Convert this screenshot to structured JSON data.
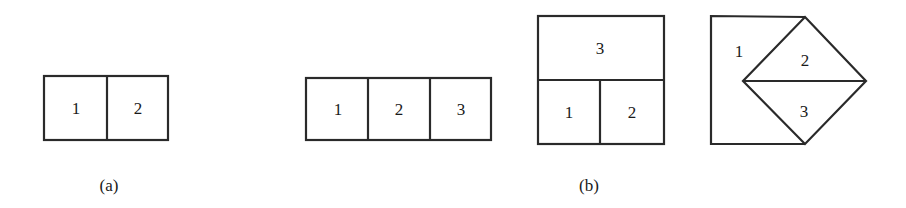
{
  "figure_a": {
    "caption": "(a)",
    "two_cell_row": {
      "cells": [
        "1",
        "2"
      ]
    }
  },
  "figure_b": {
    "caption": "(b)",
    "three_cell_row": {
      "cells": [
        "1",
        "2",
        "3"
      ]
    },
    "stacked_layout": {
      "top": "3",
      "bottom_left": "1",
      "bottom_right": "2"
    },
    "diamond_layout": {
      "left_region": "1",
      "upper_triangle": "2",
      "lower_triangle": "3"
    }
  },
  "colors": {
    "stroke": "#2a2a2a",
    "text": "#1a1a1a",
    "background": "#ffffff"
  }
}
